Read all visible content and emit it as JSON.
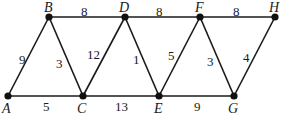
{
  "graph": {
    "nodes": [
      {
        "id": "A",
        "label": "A",
        "x": 8,
        "y": 96,
        "lx": 2,
        "ly": 113
      },
      {
        "id": "B",
        "label": "B",
        "x": 49,
        "y": 17,
        "lx": 44,
        "ly": 12
      },
      {
        "id": "C",
        "label": "C",
        "x": 83,
        "y": 96,
        "lx": 77,
        "ly": 113
      },
      {
        "id": "D",
        "label": "D",
        "x": 125,
        "y": 17,
        "lx": 119,
        "ly": 12
      },
      {
        "id": "E",
        "label": "E",
        "x": 159,
        "y": 96,
        "lx": 154,
        "ly": 113
      },
      {
        "id": "F",
        "label": "F",
        "x": 200,
        "y": 17,
        "lx": 195,
        "ly": 12
      },
      {
        "id": "G",
        "label": "G",
        "x": 234,
        "y": 96,
        "lx": 228,
        "ly": 113
      },
      {
        "id": "H",
        "label": "H",
        "x": 275,
        "y": 17,
        "lx": 269,
        "ly": 12
      }
    ],
    "edges": [
      {
        "from": "A",
        "to": "B",
        "weight": "9",
        "lx": 19,
        "ly": 64
      },
      {
        "from": "A",
        "to": "C",
        "weight": "5",
        "lx": 43,
        "ly": 111
      },
      {
        "from": "B",
        "to": "C",
        "weight": "3",
        "lx": 56,
        "ly": 68
      },
      {
        "from": "B",
        "to": "D",
        "weight": "8",
        "lx": 81,
        "ly": 16
      },
      {
        "from": "C",
        "to": "D",
        "weight": "12",
        "lx": 87,
        "ly": 59
      },
      {
        "from": "C",
        "to": "E",
        "weight": "13",
        "lx": 115,
        "ly": 111
      },
      {
        "from": "D",
        "to": "E",
        "weight": "1",
        "lx": 133,
        "ly": 64
      },
      {
        "from": "D",
        "to": "F",
        "weight": "8",
        "lx": 156,
        "ly": 16
      },
      {
        "from": "E",
        "to": "F",
        "weight": "5",
        "lx": 168,
        "ly": 60
      },
      {
        "from": "E",
        "to": "G",
        "weight": "9",
        "lx": 194,
        "ly": 111
      },
      {
        "from": "F",
        "to": "G",
        "weight": "3",
        "lx": 207,
        "ly": 66
      },
      {
        "from": "F",
        "to": "H",
        "weight": "8",
        "lx": 233,
        "ly": 16
      },
      {
        "from": "G",
        "to": "H",
        "weight": "4",
        "lx": 243,
        "ly": 62
      }
    ]
  }
}
